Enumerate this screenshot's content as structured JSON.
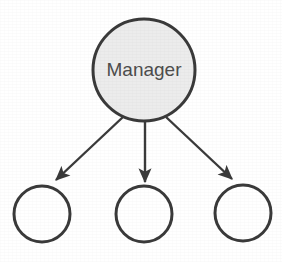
{
  "diagram": {
    "type": "node-link-hierarchy",
    "background_color": "#ffffff",
    "canvas": {
      "width": 282,
      "height": 262
    },
    "style": {
      "stroke_color": "#3a3a3a",
      "parent_fill_color": "#ececec",
      "child_fill_color": "#ffffff",
      "label_color": "#4d4d4d",
      "stroke_width": 3,
      "arrow_stroke_width": 2.4
    },
    "nodes": [
      {
        "id": "manager",
        "label": "Manager",
        "shape": "circle",
        "cx": 144,
        "cy": 70,
        "r": 51,
        "fill": "#ececec",
        "stroke": "#3a3a3a",
        "has_label": true
      },
      {
        "id": "worker-1",
        "label": "",
        "shape": "circle",
        "cx": 42,
        "cy": 214,
        "r": 28,
        "fill": "#ffffff",
        "stroke": "#3a3a3a",
        "has_label": false
      },
      {
        "id": "worker-2",
        "label": "",
        "shape": "circle",
        "cx": 144,
        "cy": 214,
        "r": 28,
        "fill": "#ffffff",
        "stroke": "#3a3a3a",
        "has_label": false
      },
      {
        "id": "worker-3",
        "label": "",
        "shape": "circle",
        "cx": 243,
        "cy": 213,
        "r": 28,
        "fill": "#ffffff",
        "stroke": "#3a3a3a",
        "has_label": false
      }
    ],
    "edges": [
      {
        "id": "edge-manager-worker-1",
        "from": "manager",
        "to": "worker-1",
        "label": "",
        "arrowhead": "solid-triangle",
        "x1": 123,
        "y1": 117,
        "x2": 55,
        "y2": 181
      },
      {
        "id": "edge-manager-worker-2",
        "from": "manager",
        "to": "worker-2",
        "label": "",
        "arrowhead": "solid-triangle",
        "x1": 145,
        "y1": 121,
        "x2": 145,
        "y2": 183
      },
      {
        "id": "edge-manager-worker-3",
        "from": "manager",
        "to": "worker-3",
        "label": "",
        "arrowhead": "solid-triangle",
        "x1": 166,
        "y1": 117,
        "x2": 231,
        "y2": 180
      }
    ]
  }
}
